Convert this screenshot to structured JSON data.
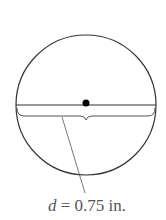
{
  "diagram": {
    "label_var": "d",
    "label_eq": " = 0.75 in.",
    "stroke_color": "#333333"
  }
}
